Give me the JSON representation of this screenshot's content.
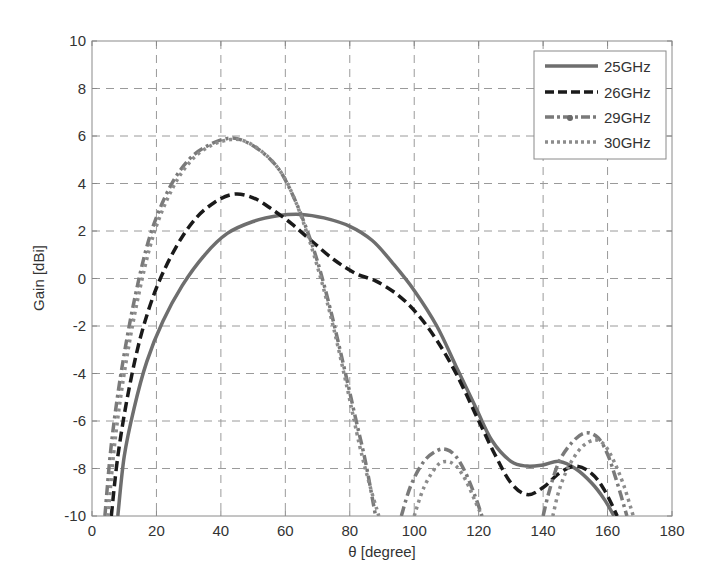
{
  "chart_data": {
    "type": "line",
    "title": "",
    "xlabel": "θ [degree]",
    "ylabel": "Gain [dBi]",
    "xlim": [
      0,
      180
    ],
    "ylim": [
      -10,
      10
    ],
    "xticks": [
      0,
      20,
      40,
      60,
      80,
      100,
      120,
      140,
      160,
      180
    ],
    "yticks": [
      -10,
      -8,
      -6,
      -4,
      -2,
      0,
      2,
      4,
      6,
      8,
      10
    ],
    "grid": true,
    "grid_style": "dashed",
    "legend_position": "upper right",
    "series": [
      {
        "name": "25GHz",
        "style": "solid",
        "color": "#6e6e6e",
        "segments": [
          [
            [
              8,
              -10
            ],
            [
              10,
              -7.5
            ],
            [
              13,
              -5.5
            ],
            [
              17,
              -3.5
            ],
            [
              22,
              -1.8
            ],
            [
              28,
              -0.3
            ],
            [
              35,
              1.0
            ],
            [
              42,
              1.9
            ],
            [
              50,
              2.4
            ],
            [
              58,
              2.65
            ],
            [
              65,
              2.7
            ],
            [
              72,
              2.55
            ],
            [
              80,
              2.2
            ],
            [
              87,
              1.6
            ],
            [
              93,
              0.7
            ],
            [
              100,
              -0.5
            ],
            [
              107,
              -2.0
            ],
            [
              113,
              -3.7
            ],
            [
              119,
              -5.4
            ],
            [
              124,
              -6.8
            ],
            [
              130,
              -7.7
            ],
            [
              135,
              -7.9
            ],
            [
              140,
              -7.85
            ],
            [
              145,
              -7.7
            ],
            [
              150,
              -8.0
            ],
            [
              155,
              -8.6
            ],
            [
              159,
              -9.3
            ],
            [
              162,
              -10
            ]
          ]
        ]
      },
      {
        "name": "26GHz",
        "style": "dashed",
        "color": "#1a1a1a",
        "segments": [
          [
            [
              6,
              -10
            ],
            [
              8,
              -7.5
            ],
            [
              11,
              -5.0
            ],
            [
              15,
              -2.5
            ],
            [
              20,
              -0.4
            ],
            [
              26,
              1.3
            ],
            [
              32,
              2.5
            ],
            [
              38,
              3.2
            ],
            [
              44,
              3.55
            ],
            [
              50,
              3.4
            ],
            [
              56,
              2.9
            ],
            [
              62,
              2.3
            ],
            [
              68,
              1.6
            ],
            [
              75,
              0.8
            ],
            [
              82,
              0.2
            ],
            [
              88,
              -0.1
            ],
            [
              95,
              -0.7
            ],
            [
              101,
              -1.5
            ],
            [
              107,
              -2.6
            ],
            [
              113,
              -4.0
            ],
            [
              119,
              -5.7
            ],
            [
              125,
              -7.4
            ],
            [
              130,
              -8.6
            ],
            [
              135,
              -9.1
            ],
            [
              140,
              -8.8
            ],
            [
              145,
              -8.2
            ],
            [
              150,
              -7.9
            ],
            [
              155,
              -8.2
            ],
            [
              159,
              -8.9
            ],
            [
              163,
              -10
            ]
          ]
        ]
      },
      {
        "name": "29GHz",
        "style": "dashdot",
        "color": "#7a7a7a",
        "segments": [
          [
            [
              4,
              -10
            ],
            [
              6,
              -7.0
            ],
            [
              9,
              -4.0
            ],
            [
              13,
              -1.0
            ],
            [
              18,
              1.8
            ],
            [
              24,
              3.8
            ],
            [
              30,
              5.0
            ],
            [
              36,
              5.6
            ],
            [
              42,
              5.9
            ],
            [
              47,
              5.8
            ],
            [
              53,
              5.3
            ],
            [
              58,
              4.6
            ],
            [
              62,
              3.6
            ],
            [
              66,
              2.3
            ],
            [
              70,
              0.7
            ],
            [
              74,
              -1.3
            ],
            [
              78,
              -3.6
            ],
            [
              82,
              -6.0
            ],
            [
              85,
              -7.8
            ],
            [
              88,
              -10
            ]
          ],
          [
            [
              96,
              -10
            ],
            [
              99,
              -8.7
            ],
            [
              103,
              -7.7
            ],
            [
              107,
              -7.25
            ],
            [
              110,
              -7.2
            ],
            [
              113,
              -7.5
            ],
            [
              116,
              -8.2
            ],
            [
              119,
              -9.2
            ],
            [
              121,
              -10
            ]
          ],
          [
            [
              140,
              -10
            ],
            [
              142,
              -8.9
            ],
            [
              145,
              -7.7
            ],
            [
              149,
              -6.9
            ],
            [
              153,
              -6.5
            ],
            [
              157,
              -6.7
            ],
            [
              160,
              -7.4
            ],
            [
              163,
              -8.6
            ],
            [
              166,
              -10
            ]
          ]
        ]
      },
      {
        "name": "30GHz",
        "style": "dotted",
        "color": "#8c8c8c",
        "segments": [
          [
            [
              5,
              -10
            ],
            [
              7,
              -7.0
            ],
            [
              10,
              -4.0
            ],
            [
              14,
              -1.0
            ],
            [
              19,
              1.8
            ],
            [
              25,
              3.8
            ],
            [
              31,
              5.0
            ],
            [
              37,
              5.6
            ],
            [
              43,
              5.85
            ],
            [
              48,
              5.75
            ],
            [
              54,
              5.2
            ],
            [
              59,
              4.4
            ],
            [
              63,
              3.3
            ],
            [
              67,
              1.8
            ],
            [
              71,
              0.0
            ],
            [
              75,
              -2.1
            ],
            [
              79,
              -4.5
            ],
            [
              83,
              -7.0
            ],
            [
              86,
              -8.6
            ],
            [
              89,
              -10
            ]
          ],
          [
            [
              100,
              -10
            ],
            [
              103,
              -8.8
            ],
            [
              107,
              -7.9
            ],
            [
              110,
              -7.7
            ],
            [
              113,
              -7.9
            ],
            [
              116,
              -8.5
            ],
            [
              119,
              -9.4
            ],
            [
              121,
              -10
            ]
          ],
          [
            [
              143,
              -10
            ],
            [
              145,
              -8.9
            ],
            [
              148,
              -7.9
            ],
            [
              152,
              -7.1
            ],
            [
              156,
              -6.8
            ],
            [
              159,
              -7.0
            ],
            [
              162,
              -7.7
            ],
            [
              165,
              -8.7
            ],
            [
              168,
              -10
            ]
          ]
        ]
      }
    ]
  },
  "axes": {
    "x_label": "θ [degree]",
    "y_label": "Gain [dBi]",
    "x_tick_labels": [
      "0",
      "20",
      "40",
      "60",
      "80",
      "100",
      "120",
      "140",
      "160",
      "180"
    ],
    "y_tick_labels": [
      "-10",
      "-8",
      "-6",
      "-4",
      "-2",
      "0",
      "2",
      "4",
      "6",
      "8",
      "10"
    ]
  },
  "legend": {
    "items": [
      {
        "label": "25GHz"
      },
      {
        "label": "26GHz"
      },
      {
        "label": "29GHz"
      },
      {
        "label": "30GHz"
      }
    ]
  },
  "colors": {
    "axis": "#888888",
    "grid": "#9a9a9a",
    "text": "#333333",
    "background": "#ffffff"
  }
}
